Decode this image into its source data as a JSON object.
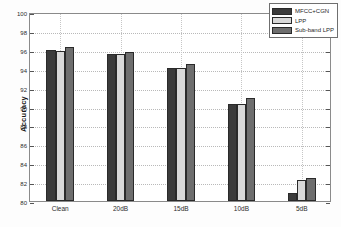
{
  "chart_data": {
    "type": "bar",
    "title": "",
    "xlabel": "",
    "ylabel": "Accuracy",
    "categories": [
      "Clean",
      "20dB",
      "15dB",
      "10dB",
      "5dB"
    ],
    "ylim": [
      80,
      100
    ],
    "ytick_step": 2,
    "yticks": [
      "100",
      "98",
      "96",
      "94",
      "92",
      "90",
      "88",
      "86",
      "84",
      "82",
      "80"
    ],
    "grid": true,
    "legend_position": "top-right",
    "series": [
      {
        "name": "MFCC+CGN",
        "color": "#3b3b3b",
        "values": [
          96.0,
          95.6,
          94.05,
          90.25,
          80.9
        ]
      },
      {
        "name": "LPP",
        "color": "#d9d9d9",
        "values": [
          95.85,
          95.55,
          94.05,
          90.3,
          82.2
        ]
      },
      {
        "name": "Sub-band LPP",
        "color": "#6e6e6e",
        "values": [
          96.3,
          95.8,
          94.5,
          90.95,
          82.4
        ]
      }
    ]
  },
  "axes": {
    "y_axis_label": "Accuracy"
  }
}
